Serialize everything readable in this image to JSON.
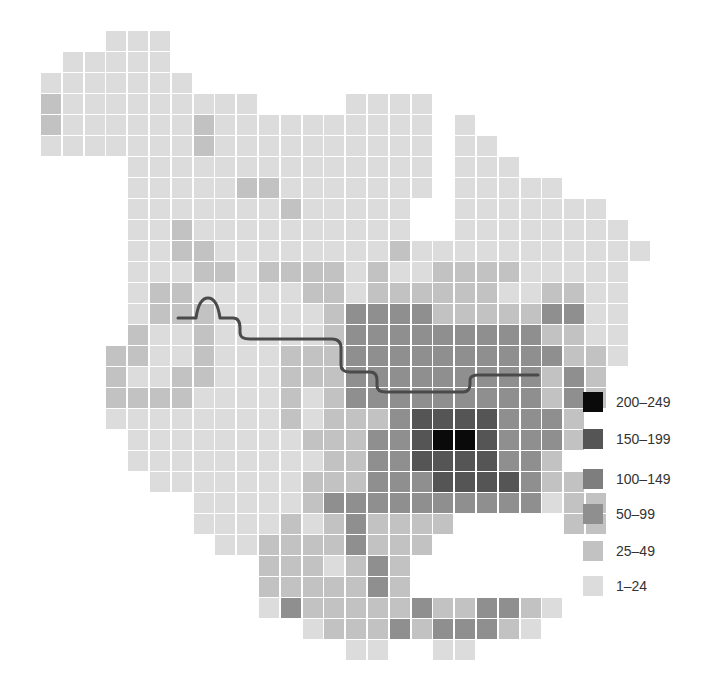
{
  "chart_data": {
    "type": "heatmap",
    "title": "",
    "grid": {
      "origin_x": 41,
      "origin_y": 31,
      "pitch_x": 21.8,
      "pitch_y": 21,
      "cell_size": 20,
      "legend_key": "0=empty,1=1–24,2=25–49,3=50–99,4=100–149,5=150–199,6=200–249",
      "rows": [
        "0001110000000000000000000000",
        "0111110000000000000000000000",
        "1111111000000000000000000000",
        "2111111111000011110000000000",
        "2111111211111111110100000000",
        "1111111211111111110110000000",
        "0000111111111111110111000000",
        "0000111112211111110111110000",
        "0000111111121111100111111100",
        "0000112111111111100111111110",
        "0000112211111111211111111111",
        "0000111221222212112222111110",
        "0000122111112212222221122110",
        "0000122211111233332222233110",
        "0000211211111233333333322110",
        "0002211211122233333333332210",
        "0002112211122233333333323200",
        "0002222111121233333333323200",
        "0001111111121222355553332000",
        "0000111111112223356653332000",
        "0000111111111223355553320000",
        "0000011111112223335555322000",
        "0000000111112333333333312200",
        "0000000111121232222000002200",
        "0000000011222232220000000000",
        "0000000000222123200000000000",
        "0000000000222223200000000000",
        "0000000000132222232233210000",
        "0000000000001222323332100000",
        "0000000000000011001100000000"
      ]
    },
    "legend": [
      {
        "label": "200–249",
        "level": 6
      },
      {
        "label": "150–199",
        "level": 5
      },
      {
        "label": "100–149",
        "level": 4
      },
      {
        "label": "50–99",
        "level": 3
      },
      {
        "label": "25–49",
        "level": 2
      },
      {
        "label": "1–24",
        "level": 1
      }
    ],
    "colors": {
      "1": "#dcdcdc",
      "2": "#c2c2c2",
      "3": "#8f8f8f",
      "4": "#7e7e7e",
      "5": "#555555",
      "6": "#0a0a0a"
    },
    "grid_line_color": "#b8b8b8",
    "river": {
      "color": "#4a4a4a",
      "width": 3,
      "path": "M178,318 L196,318 C198,304 202,298 208,298 C214,298 218,304 220,318 L233,318 C238,318 240,322 240,328 L240,332 C240,337 243,339 250,339 L332,339 C338,339 341,342 341,348 L341,365 C341,370 344,372 350,372 L370,372 C375,372 377,375 377,380 L377,386 C377,390 380,392 386,392 L463,392 C468,392 470,389 470,384 L470,380 C470,376 473,375 478,375 L538,375"
    }
  },
  "legend_labels": [
    "200–249",
    "150–199",
    "100–149",
    "50–99",
    "25–49",
    "1–24"
  ]
}
